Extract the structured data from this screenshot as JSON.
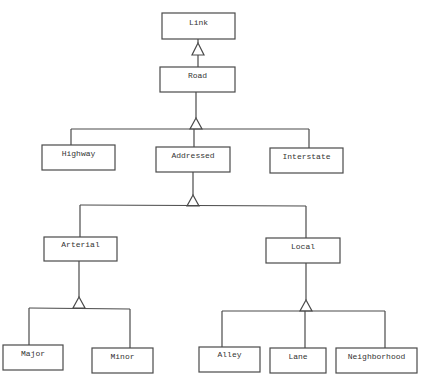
{
  "diagram": {
    "type": "UML class generalization hierarchy",
    "nodes": {
      "link": "Link",
      "road": "Road",
      "highway": "Highway",
      "addressed": "Addressed",
      "interstate": "Interstate",
      "arterial": "Arterial",
      "local": "Local",
      "major": "Major",
      "minor": "Minor",
      "alley": "Alley",
      "lane": "Lane",
      "neighborhood": "Neighborhood"
    },
    "edges": [
      {
        "child": "Road",
        "parent": "Link",
        "kind": "generalization"
      },
      {
        "child": "Highway",
        "parent": "Road",
        "kind": "generalization"
      },
      {
        "child": "Addressed",
        "parent": "Road",
        "kind": "generalization"
      },
      {
        "child": "Interstate",
        "parent": "Road",
        "kind": "generalization"
      },
      {
        "child": "Arterial",
        "parent": "Addressed",
        "kind": "generalization"
      },
      {
        "child": "Local",
        "parent": "Addressed",
        "kind": "generalization"
      },
      {
        "child": "Major",
        "parent": "Arterial",
        "kind": "generalization"
      },
      {
        "child": "Minor",
        "parent": "Arterial",
        "kind": "generalization"
      },
      {
        "child": "Alley",
        "parent": "Local",
        "kind": "generalization"
      },
      {
        "child": "Lane",
        "parent": "Local",
        "kind": "generalization"
      },
      {
        "child": "Neighborhood",
        "parent": "Local",
        "kind": "generalization"
      }
    ],
    "colors": {
      "stroke": "#4a4a4a",
      "text": "#333333",
      "background": "#ffffff"
    }
  }
}
